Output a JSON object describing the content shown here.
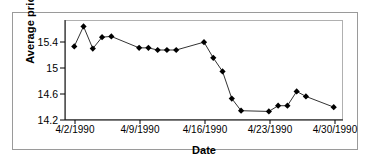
{
  "chart_data": {
    "type": "line",
    "title": "",
    "xlabel": "Date",
    "ylabel": "Average price",
    "ylim": [
      14.2,
      15.6
    ],
    "yticks": [
      "14.2",
      "14.6",
      "15",
      "15.4"
    ],
    "ytick_values": [
      14.2,
      14.6,
      15.0,
      15.4
    ],
    "xticks": [
      "4/2/1990",
      "4/9/1990",
      "4/16/1990",
      "4/23/1990",
      "4/30/1990"
    ],
    "xtick_values": [
      2,
      9,
      16,
      23,
      30
    ],
    "xlim": [
      1,
      31
    ],
    "grid": false,
    "legend": "none",
    "marker": "diamond",
    "marker_color": "#000000",
    "line_color": "#333333",
    "x": [
      2,
      3,
      4,
      5,
      6,
      9,
      10,
      11,
      12,
      13,
      16,
      17,
      18,
      19,
      20,
      23,
      24,
      25,
      26,
      27,
      30
    ],
    "values": [
      15.23,
      15.51,
      15.2,
      15.36,
      15.37,
      15.21,
      15.21,
      15.18,
      15.18,
      15.18,
      15.29,
      15.07,
      14.88,
      14.5,
      14.33,
      14.32,
      14.4,
      14.4,
      14.6,
      14.53,
      14.38
    ],
    "series": [
      {
        "name": "Average price",
        "points": [
          {
            "date": "4/2/1990",
            "value": 15.23
          },
          {
            "date": "4/3/1990",
            "value": 15.51
          },
          {
            "date": "4/4/1990",
            "value": 15.2
          },
          {
            "date": "4/5/1990",
            "value": 15.36
          },
          {
            "date": "4/6/1990",
            "value": 15.37
          },
          {
            "date": "4/9/1990",
            "value": 15.21
          },
          {
            "date": "4/10/1990",
            "value": 15.21
          },
          {
            "date": "4/11/1990",
            "value": 15.18
          },
          {
            "date": "4/12/1990",
            "value": 15.18
          },
          {
            "date": "4/13/1990",
            "value": 15.18
          },
          {
            "date": "4/16/1990",
            "value": 15.29
          },
          {
            "date": "4/17/1990",
            "value": 15.07
          },
          {
            "date": "4/18/1990",
            "value": 14.88
          },
          {
            "date": "4/19/1990",
            "value": 14.5
          },
          {
            "date": "4/20/1990",
            "value": 14.33
          },
          {
            "date": "4/23/1990",
            "value": 14.32
          },
          {
            "date": "4/24/1990",
            "value": 14.4
          },
          {
            "date": "4/25/1990",
            "value": 14.4
          },
          {
            "date": "4/26/1990",
            "value": 14.6
          },
          {
            "date": "4/27/1990",
            "value": 14.53
          },
          {
            "date": "4/30/1990",
            "value": 14.38
          }
        ]
      }
    ]
  }
}
